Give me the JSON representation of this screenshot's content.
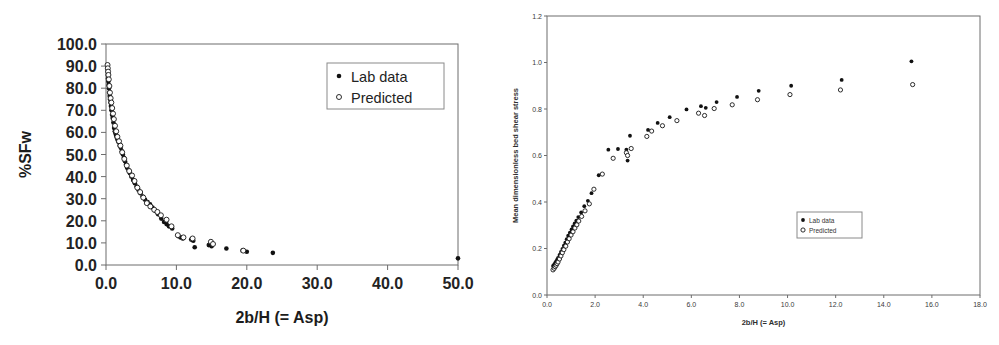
{
  "figure": {
    "panel_count": 2,
    "background_color": "#ffffff",
    "marker_color_lab": "#111111",
    "marker_color_predicted": "#ffffff",
    "marker_outline_predicted": "#161616",
    "axis_color": "#6d6d6d"
  },
  "chart_data": [
    {
      "id": "left-chart",
      "type": "scatter",
      "title": "",
      "xlabel": "2b/H (= Asp)",
      "ylabel": "%SFw",
      "xlim": [
        0.0,
        50.0
      ],
      "ylim": [
        0.0,
        100.0
      ],
      "xticks": [
        "0.0",
        "10.0",
        "20.0",
        "30.0",
        "40.0",
        "50.0"
      ],
      "xtick_values": [
        0,
        10,
        20,
        30,
        40,
        50
      ],
      "yticks": [
        "0.0",
        "10.0",
        "20.0",
        "30.0",
        "40.0",
        "50.0",
        "60.0",
        "70.0",
        "80.0",
        "90.0",
        "100.0"
      ],
      "ytick_values": [
        0,
        10,
        20,
        30,
        40,
        50,
        60,
        70,
        80,
        90,
        100
      ],
      "grid": false,
      "legend_position": "top-right",
      "series": [
        {
          "name": "Lab data",
          "marker": "filled-dot",
          "points": [
            [
              0.22,
              89.0
            ],
            [
              0.25,
              87.5
            ],
            [
              0.28,
              86.0
            ],
            [
              0.3,
              84.5
            ],
            [
              0.34,
              83.0
            ],
            [
              0.38,
              81.5
            ],
            [
              0.42,
              80.0
            ],
            [
              0.46,
              78.0
            ],
            [
              0.52,
              76.5
            ],
            [
              0.58,
              75.0
            ],
            [
              0.64,
              73.5
            ],
            [
              0.7,
              72.0
            ],
            [
              0.78,
              70.0
            ],
            [
              0.86,
              68.0
            ],
            [
              0.95,
              66.5
            ],
            [
              1.05,
              64.5
            ],
            [
              1.15,
              62.0
            ],
            [
              1.25,
              60.5
            ],
            [
              1.35,
              59.5
            ],
            [
              1.45,
              58.5
            ],
            [
              1.55,
              57.5
            ],
            [
              1.68,
              56.5
            ],
            [
              1.8,
              55.5
            ],
            [
              1.95,
              54.0
            ],
            [
              2.1,
              53.0
            ],
            [
              2.25,
              51.5
            ],
            [
              2.4,
              50.0
            ],
            [
              2.55,
              48.5
            ],
            [
              2.7,
              47.0
            ],
            [
              2.85,
              45.5
            ],
            [
              3.0,
              44.0
            ],
            [
              3.2,
              43.0
            ],
            [
              3.4,
              41.5
            ],
            [
              3.6,
              40.0
            ],
            [
              3.85,
              38.5
            ],
            [
              4.1,
              37.0
            ],
            [
              4.35,
              35.5
            ],
            [
              4.6,
              34.0
            ],
            [
              4.9,
              32.5
            ],
            [
              5.2,
              31.0
            ],
            [
              5.55,
              29.5
            ],
            [
              5.9,
              28.5
            ],
            [
              6.25,
              27.5
            ],
            [
              6.6,
              26.0
            ],
            [
              7.0,
              24.5
            ],
            [
              7.4,
              23.0
            ],
            [
              7.85,
              21.0
            ],
            [
              8.25,
              19.5
            ],
            [
              8.6,
              18.5
            ],
            [
              8.95,
              17.5
            ],
            [
              9.4,
              16.5
            ],
            [
              10.3,
              13.0
            ],
            [
              10.6,
              12.5
            ],
            [
              10.9,
              12.0
            ],
            [
              12.1,
              11.5
            ],
            [
              12.4,
              11.0
            ],
            [
              12.6,
              8.0
            ],
            [
              14.6,
              9.0
            ],
            [
              15.0,
              8.5
            ],
            [
              17.1,
              7.5
            ],
            [
              19.4,
              6.5
            ],
            [
              20.0,
              6.0
            ],
            [
              23.7,
              5.5
            ],
            [
              50.0,
              3.0
            ]
          ]
        },
        {
          "name": "Predicted",
          "marker": "open-circle",
          "points": [
            [
              0.22,
              90.5
            ],
            [
              0.26,
              89.0
            ],
            [
              0.3,
              87.5
            ],
            [
              0.34,
              86.0
            ],
            [
              0.4,
              84.0
            ],
            [
              0.48,
              81.0
            ],
            [
              0.56,
              78.0
            ],
            [
              0.66,
              75.5
            ],
            [
              0.76,
              73.5
            ],
            [
              0.88,
              71.0
            ],
            [
              1.0,
              68.5
            ],
            [
              1.12,
              66.0
            ],
            [
              1.28,
              63.0
            ],
            [
              1.45,
              60.5
            ],
            [
              1.62,
              58.0
            ],
            [
              1.85,
              56.0
            ],
            [
              2.05,
              54.0
            ],
            [
              2.3,
              51.0
            ],
            [
              2.6,
              48.0
            ],
            [
              2.95,
              45.0
            ],
            [
              3.3,
              42.5
            ],
            [
              3.7,
              40.5
            ],
            [
              4.05,
              38.0
            ],
            [
              4.45,
              35.0
            ],
            [
              4.85,
              33.0
            ],
            [
              5.3,
              30.5
            ],
            [
              5.8,
              28.0
            ],
            [
              6.3,
              26.5
            ],
            [
              6.85,
              25.0
            ],
            [
              7.3,
              24.0
            ],
            [
              7.8,
              22.5
            ],
            [
              8.6,
              20.5
            ],
            [
              9.3,
              17.5
            ],
            [
              10.2,
              13.5
            ],
            [
              11.0,
              12.5
            ],
            [
              12.3,
              12.0
            ],
            [
              14.9,
              10.5
            ],
            [
              15.2,
              9.5
            ],
            [
              19.5,
              6.5
            ]
          ]
        }
      ]
    },
    {
      "id": "right-chart",
      "type": "scatter",
      "title": "",
      "xlabel": "2b/H (= Asp)",
      "ylabel": "Mean dimensionless bed shear stress",
      "xlim": [
        0.0,
        18.0
      ],
      "ylim": [
        0.0,
        1.2
      ],
      "xticks": [
        "0.0",
        "2.0",
        "4.0",
        "6.0",
        "8.0",
        "10.0",
        "12.0",
        "14.0",
        "16.0",
        "18.0"
      ],
      "xtick_values": [
        0,
        2,
        4,
        6,
        8,
        10,
        12,
        14,
        16,
        18
      ],
      "yticks": [
        "0.0",
        "0.2",
        "0.4",
        "0.6",
        "0.8",
        "1.0",
        "1.2"
      ],
      "ytick_values": [
        0.0,
        0.2,
        0.4,
        0.6,
        0.8,
        1.0,
        1.2
      ],
      "grid": false,
      "legend_position": "center-right",
      "series": [
        {
          "name": "Lab data",
          "marker": "filled-dot",
          "points": [
            [
              0.25,
              0.125
            ],
            [
              0.3,
              0.132
            ],
            [
              0.34,
              0.138
            ],
            [
              0.38,
              0.145
            ],
            [
              0.42,
              0.152
            ],
            [
              0.46,
              0.16
            ],
            [
              0.52,
              0.172
            ],
            [
              0.58,
              0.185
            ],
            [
              0.64,
              0.198
            ],
            [
              0.7,
              0.212
            ],
            [
              0.76,
              0.225
            ],
            [
              0.82,
              0.24
            ],
            [
              0.88,
              0.255
            ],
            [
              0.95,
              0.268
            ],
            [
              1.02,
              0.282
            ],
            [
              1.08,
              0.295
            ],
            [
              1.15,
              0.308
            ],
            [
              1.22,
              0.32
            ],
            [
              1.3,
              0.335
            ],
            [
              1.42,
              0.355
            ],
            [
              1.55,
              0.382
            ],
            [
              1.7,
              0.405
            ],
            [
              1.85,
              0.438
            ],
            [
              2.15,
              0.515
            ],
            [
              2.55,
              0.625
            ],
            [
              2.95,
              0.628
            ],
            [
              3.3,
              0.625
            ],
            [
              3.35,
              0.578
            ],
            [
              3.45,
              0.685
            ],
            [
              4.2,
              0.71
            ],
            [
              4.6,
              0.74
            ],
            [
              5.1,
              0.765
            ],
            [
              5.8,
              0.798
            ],
            [
              6.4,
              0.812
            ],
            [
              6.6,
              0.805
            ],
            [
              7.05,
              0.83
            ],
            [
              7.9,
              0.852
            ],
            [
              8.8,
              0.878
            ],
            [
              10.15,
              0.9
            ],
            [
              12.25,
              0.925
            ],
            [
              15.15,
              1.005
            ]
          ]
        },
        {
          "name": "Predicted",
          "marker": "open-circle",
          "points": [
            [
              0.25,
              0.108
            ],
            [
              0.3,
              0.115
            ],
            [
              0.34,
              0.122
            ],
            [
              0.38,
              0.128
            ],
            [
              0.42,
              0.135
            ],
            [
              0.46,
              0.142
            ],
            [
              0.52,
              0.155
            ],
            [
              0.58,
              0.168
            ],
            [
              0.64,
              0.182
            ],
            [
              0.7,
              0.195
            ],
            [
              0.78,
              0.21
            ],
            [
              0.85,
              0.228
            ],
            [
              0.92,
              0.242
            ],
            [
              1.0,
              0.258
            ],
            [
              1.08,
              0.272
            ],
            [
              1.16,
              0.288
            ],
            [
              1.24,
              0.302
            ],
            [
              1.32,
              0.318
            ],
            [
              1.44,
              0.338
            ],
            [
              1.58,
              0.362
            ],
            [
              1.76,
              0.392
            ],
            [
              1.95,
              0.455
            ],
            [
              2.3,
              0.52
            ],
            [
              2.75,
              0.588
            ],
            [
              3.3,
              0.612
            ],
            [
              3.35,
              0.6
            ],
            [
              3.5,
              0.63
            ],
            [
              4.15,
              0.682
            ],
            [
              4.35,
              0.705
            ],
            [
              4.8,
              0.728
            ],
            [
              5.4,
              0.75
            ],
            [
              6.3,
              0.782
            ],
            [
              6.55,
              0.772
            ],
            [
              6.95,
              0.802
            ],
            [
              7.7,
              0.818
            ],
            [
              8.75,
              0.84
            ],
            [
              10.1,
              0.862
            ],
            [
              12.2,
              0.882
            ],
            [
              15.2,
              0.905
            ]
          ]
        }
      ]
    }
  ]
}
